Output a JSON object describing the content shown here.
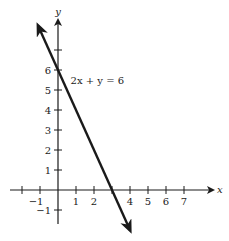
{
  "chart_data": {
    "type": "line",
    "title": "",
    "xlabel": "x",
    "ylabel": "y",
    "xlim": [
      -2.5,
      8
    ],
    "ylim": [
      -1.5,
      8.5
    ],
    "x_ticks": [
      -2,
      -1,
      1,
      2,
      3,
      4,
      5,
      6,
      7
    ],
    "x_tick_labels": [
      {
        "value": -1,
        "label": "−1"
      },
      {
        "value": 1,
        "label": "1"
      },
      {
        "value": 2,
        "label": "2"
      },
      {
        "value": 4,
        "label": "4"
      },
      {
        "value": 5,
        "label": "5"
      },
      {
        "value": 6,
        "label": "6"
      },
      {
        "value": 7,
        "label": "7"
      }
    ],
    "y_ticks": [
      -1,
      1,
      2,
      3,
      4,
      5,
      6,
      7
    ],
    "y_tick_labels": [
      {
        "value": -1,
        "label": "−1"
      },
      {
        "value": 1,
        "label": "1"
      },
      {
        "value": 2,
        "label": "2"
      },
      {
        "value": 3,
        "label": "3"
      },
      {
        "value": 4,
        "label": "4"
      },
      {
        "value": 5,
        "label": "5"
      },
      {
        "value": 6,
        "label": "6"
      }
    ],
    "series": [
      {
        "name": "2x + y = 6",
        "equation": {
          "slope": -2,
          "intercept": 6
        },
        "x_range": [
          -1.1,
          4.0
        ],
        "arrows": "both"
      }
    ],
    "annotations": [
      {
        "text": "2x + y = 6",
        "x": 0.7,
        "y": 5.3
      }
    ],
    "grid": false,
    "legend": "none"
  }
}
